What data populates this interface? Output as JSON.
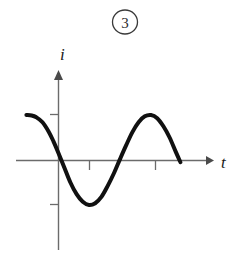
{
  "figure": {
    "number_label": "3",
    "number_circled_glyph": "③",
    "caption": ""
  },
  "axes": {
    "x_label": "t",
    "y_label": "i",
    "x_axis_color": "#6b6b6b",
    "y_axis_color": "#6b6b6b",
    "tick_color": "#6b6b6b",
    "x_ticks": [
      {
        "label": "",
        "position": 89
      },
      {
        "label": "",
        "position": 155
      }
    ],
    "y_ticks": [
      {
        "label": "",
        "position": 115
      },
      {
        "label": "",
        "position": 205
      }
    ],
    "origin": {
      "x": 58,
      "y": 160
    },
    "x_axis_start": 16,
    "x_axis_arrow_tip": 213,
    "y_axis_arrow_tip": 72,
    "y_axis_bottom": 250
  },
  "chart_data": {
    "type": "line",
    "title": "",
    "subtitle": "",
    "xlabel": "t",
    "ylabel": "i",
    "grid": false,
    "legend": null,
    "annotations": [
      {
        "text": "③",
        "role": "figure-number"
      }
    ],
    "xlim": [
      -1.0,
      4.2
    ],
    "ylim": [
      -1.25,
      1.25
    ],
    "series": [
      {
        "name": "i(t)",
        "color": "#111111",
        "line_width": 4,
        "x": [
          -1.02,
          -0.85,
          -0.7,
          -0.5,
          -0.3,
          -0.15,
          0.0,
          0.2,
          0.4,
          0.6,
          0.8,
          1.0,
          1.2,
          1.4,
          1.6,
          1.8,
          2.0,
          2.2,
          2.4,
          2.6,
          2.8,
          3.0,
          3.2,
          3.4,
          3.6,
          3.8,
          3.95
        ],
        "y": [
          1.0,
          0.99,
          0.95,
          0.84,
          0.63,
          0.42,
          0.18,
          -0.16,
          -0.5,
          -0.76,
          -0.93,
          -1.0,
          -0.96,
          -0.82,
          -0.58,
          -0.3,
          0.02,
          0.33,
          0.62,
          0.84,
          0.97,
          1.0,
          0.93,
          0.75,
          0.5,
          0.18,
          -0.05
        ],
        "points_of_interest": [
          {
            "name": "start",
            "x": -1.02,
            "y": 1.0
          },
          {
            "name": "zero-crossing-falling",
            "x": 0.1,
            "y": 0.0
          },
          {
            "name": "trough",
            "x": 1.0,
            "y": -1.0
          },
          {
            "name": "zero-crossing-rising",
            "x": 2.0,
            "y": 0.0
          },
          {
            "name": "crest",
            "x": 3.03,
            "y": 1.0
          },
          {
            "name": "zero-crossing-falling-2",
            "x": 3.9,
            "y": 0.0
          },
          {
            "name": "end",
            "x": 4.02,
            "y": -0.3
          }
        ]
      }
    ]
  }
}
